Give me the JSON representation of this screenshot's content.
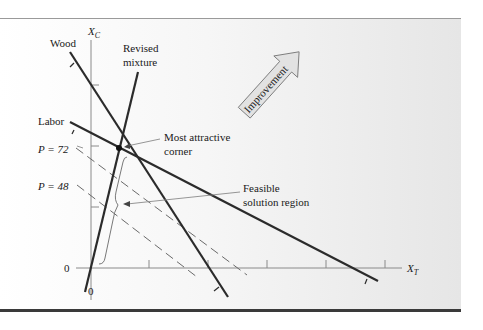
{
  "diagram": {
    "axes": {
      "y_label": "X",
      "y_label_sub": "C",
      "x_label": "X",
      "x_label_sub": "T",
      "origin_y_label": "0",
      "origin_x_label": "0"
    },
    "constraints": {
      "wood_label": "Wood",
      "labor_label": "Labor",
      "revised_mixture_label_line1": "Revised",
      "revised_mixture_label_line2": "mixture"
    },
    "profit_lines": {
      "p72_label": "P = 72",
      "p48_label": "P = 48"
    },
    "annotations": {
      "corner_line1": "Most attractive",
      "corner_line2": "corner",
      "feasible_line1": "Feasible",
      "feasible_line2": "solution region",
      "improvement_label": "Improvement"
    },
    "colors": {
      "line": "#2b2b2b",
      "dashed": "#6a6a6a",
      "arrow_fill": "#e2e2e2"
    }
  }
}
